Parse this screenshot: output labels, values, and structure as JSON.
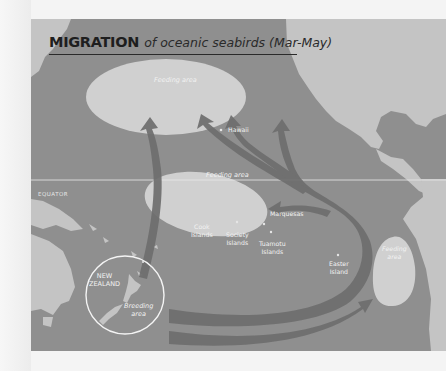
{
  "title": {
    "strong": "MIGRATION",
    "em": "of oceanic seabirds (Mar-May)"
  },
  "equator_label": "EQUATOR",
  "places": {
    "hawaii": "Hawaii",
    "marquesas": "Marquesas",
    "cook_1": "Cook",
    "cook_2": "Islands",
    "society_1": "Society",
    "society_2": "Islands",
    "tuamotu_1": "Tuamotu",
    "tuamotu_2": "Islands",
    "easter_1": "Easter",
    "easter_2": "Island",
    "nz_1": "NEW",
    "nz_2": "ZEALAND"
  },
  "areas": {
    "feeding_north": "Feeding area",
    "feeding_equator": "Feeding area",
    "feeding_east_1": "Feeding",
    "feeding_east_2": "area",
    "breeding_1": "Breeding",
    "breeding_2": "area"
  },
  "colors": {
    "ocean": "#8f8f8f",
    "land": "#c4c4c4",
    "feeding_area": "#d0d0d0",
    "arrow": "#6e6e6e",
    "title_text": "#1e1e1e"
  }
}
